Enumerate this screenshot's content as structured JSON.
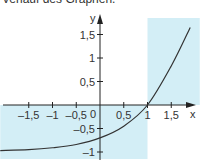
{
  "caption": "Verlauf des Graphen.",
  "chart_data": {
    "type": "line",
    "title": "",
    "xlabel": "x",
    "ylabel": "y",
    "xlim": [
      -2.1,
      2.1
    ],
    "ylim": [
      -1.15,
      2.0
    ],
    "x_ticks": [
      -1.5,
      -1,
      -0.5,
      0.5,
      1,
      1.5
    ],
    "x_tick_labels": [
      "–1,5",
      "–1",
      "–0,5",
      "0,5",
      "1",
      "1,5"
    ],
    "y_ticks": [
      1.5,
      1,
      0.5,
      -0.5,
      -1
    ],
    "y_tick_labels": [
      "1,5",
      "1",
      "0,5",
      "–0,5",
      "–1"
    ],
    "origin_label": "0",
    "shaded_regions": [
      {
        "description": "x from left edge to 1, y below 0",
        "x": [
          -2.1,
          1
        ],
        "y": [
          -1.15,
          0
        ]
      },
      {
        "description": "x from 1 to right edge, y above 0",
        "x": [
          1,
          2.1
        ],
        "y": [
          0,
          2.0
        ]
      }
    ],
    "series": [
      {
        "name": "f",
        "x": [
          -2.1,
          -1.5,
          -1,
          -0.5,
          0,
          0.5,
          1,
          1.5,
          1.9
        ],
        "y": [
          -0.97,
          -0.95,
          -0.91,
          -0.84,
          -0.7,
          -0.45,
          0,
          0.83,
          1.65
        ]
      }
    ],
    "colors": {
      "shade": "#d3eef6",
      "curve": "#333333",
      "axis": "#222222"
    }
  }
}
